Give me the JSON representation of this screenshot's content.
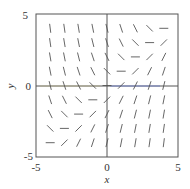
{
  "chart_data": {
    "type": "direction-field",
    "title": "",
    "equation": "dy/dx = x - y",
    "xlabel": "x",
    "ylabel": "y",
    "xlim": [
      -5,
      5
    ],
    "ylim": [
      -5,
      5
    ],
    "x_ticks": [
      "-5",
      "0",
      "5"
    ],
    "y_ticks": [
      "5",
      "0",
      "-5"
    ],
    "grid": false,
    "legend": null,
    "grid_points": {
      "x": [
        -4,
        -3,
        -2,
        -1,
        0,
        1,
        2,
        3,
        4
      ],
      "y": [
        -4,
        -3,
        -2,
        -1,
        0,
        1,
        2,
        3,
        4
      ]
    },
    "isocline_zero_slope": "y = x",
    "colors": {
      "frame": "#555555",
      "segments": "#555555",
      "axis_x_right_tint": "#6f7fd0",
      "axis_x_left_tint": "#b8b27a"
    }
  },
  "labels": {
    "x_tick_min": "-5",
    "x_tick_mid": "0",
    "x_tick_max": "5",
    "y_tick_max": "5",
    "y_tick_mid": "0",
    "y_tick_min": "-5",
    "xlabel": "x",
    "ylabel": "y"
  }
}
